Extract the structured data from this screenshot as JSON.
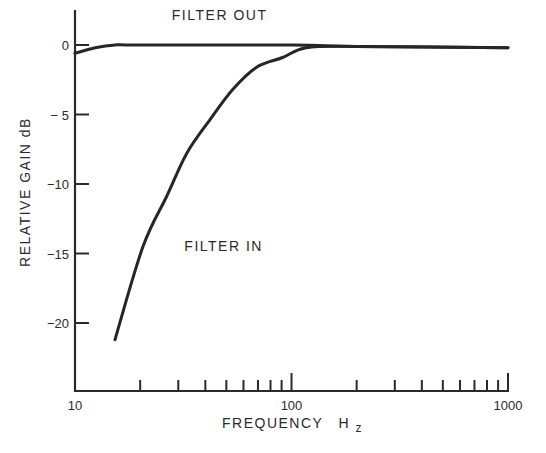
{
  "chart_data": {
    "type": "line",
    "title": "",
    "xlabel": "FREQUENCY",
    "xlabel_unit_main": "H",
    "xlabel_unit_sub": "z",
    "ylabel": "RELATIVE GAIN dB",
    "xscale": "log",
    "xlim": [
      10,
      1000
    ],
    "ylim": [
      -24.8,
      2.5
    ],
    "grid": false,
    "x_tick_labels": [
      {
        "value": 10,
        "label": "10"
      },
      {
        "value": 100,
        "label": "100"
      },
      {
        "value": 1000,
        "label": "1000"
      }
    ],
    "x_minor_ticks": [
      20,
      30,
      40,
      50,
      60,
      70,
      80,
      90,
      200,
      300,
      400,
      500,
      600,
      700,
      800,
      900
    ],
    "y_ticks": [
      {
        "value": 0,
        "label": "0"
      },
      {
        "value": -5,
        "label": "− 5"
      },
      {
        "value": -10,
        "label": "−10"
      },
      {
        "value": -15,
        "label": "−15"
      },
      {
        "value": -20,
        "label": "−20"
      }
    ],
    "series": [
      {
        "name": "FILTER OUT",
        "points": [
          [
            10,
            -0.6
          ],
          [
            12.4,
            -0.2
          ],
          [
            15.3,
            0
          ],
          [
            20,
            0
          ],
          [
            100,
            0
          ],
          [
            200,
            -0.1
          ],
          [
            1000,
            -0.2
          ]
        ]
      },
      {
        "name": "FILTER IN",
        "points": [
          [
            15.3,
            -21.2
          ],
          [
            20.6,
            -14.5
          ],
          [
            26.5,
            -10.9
          ],
          [
            32.8,
            -7.8
          ],
          [
            41.9,
            -5.4
          ],
          [
            53.5,
            -3.2
          ],
          [
            69,
            -1.6
          ],
          [
            91,
            -0.9
          ],
          [
            117,
            -0.2
          ],
          [
            200,
            -0.1
          ],
          [
            1000,
            -0.2
          ]
        ]
      }
    ],
    "annotations": [
      {
        "text": "FILTER OUT",
        "series": "FILTER OUT",
        "anchor": [
          28,
          1.8
        ]
      },
      {
        "text": "FILTER IN",
        "series": "FILTER IN",
        "anchor": [
          32,
          -14.8
        ]
      }
    ]
  }
}
